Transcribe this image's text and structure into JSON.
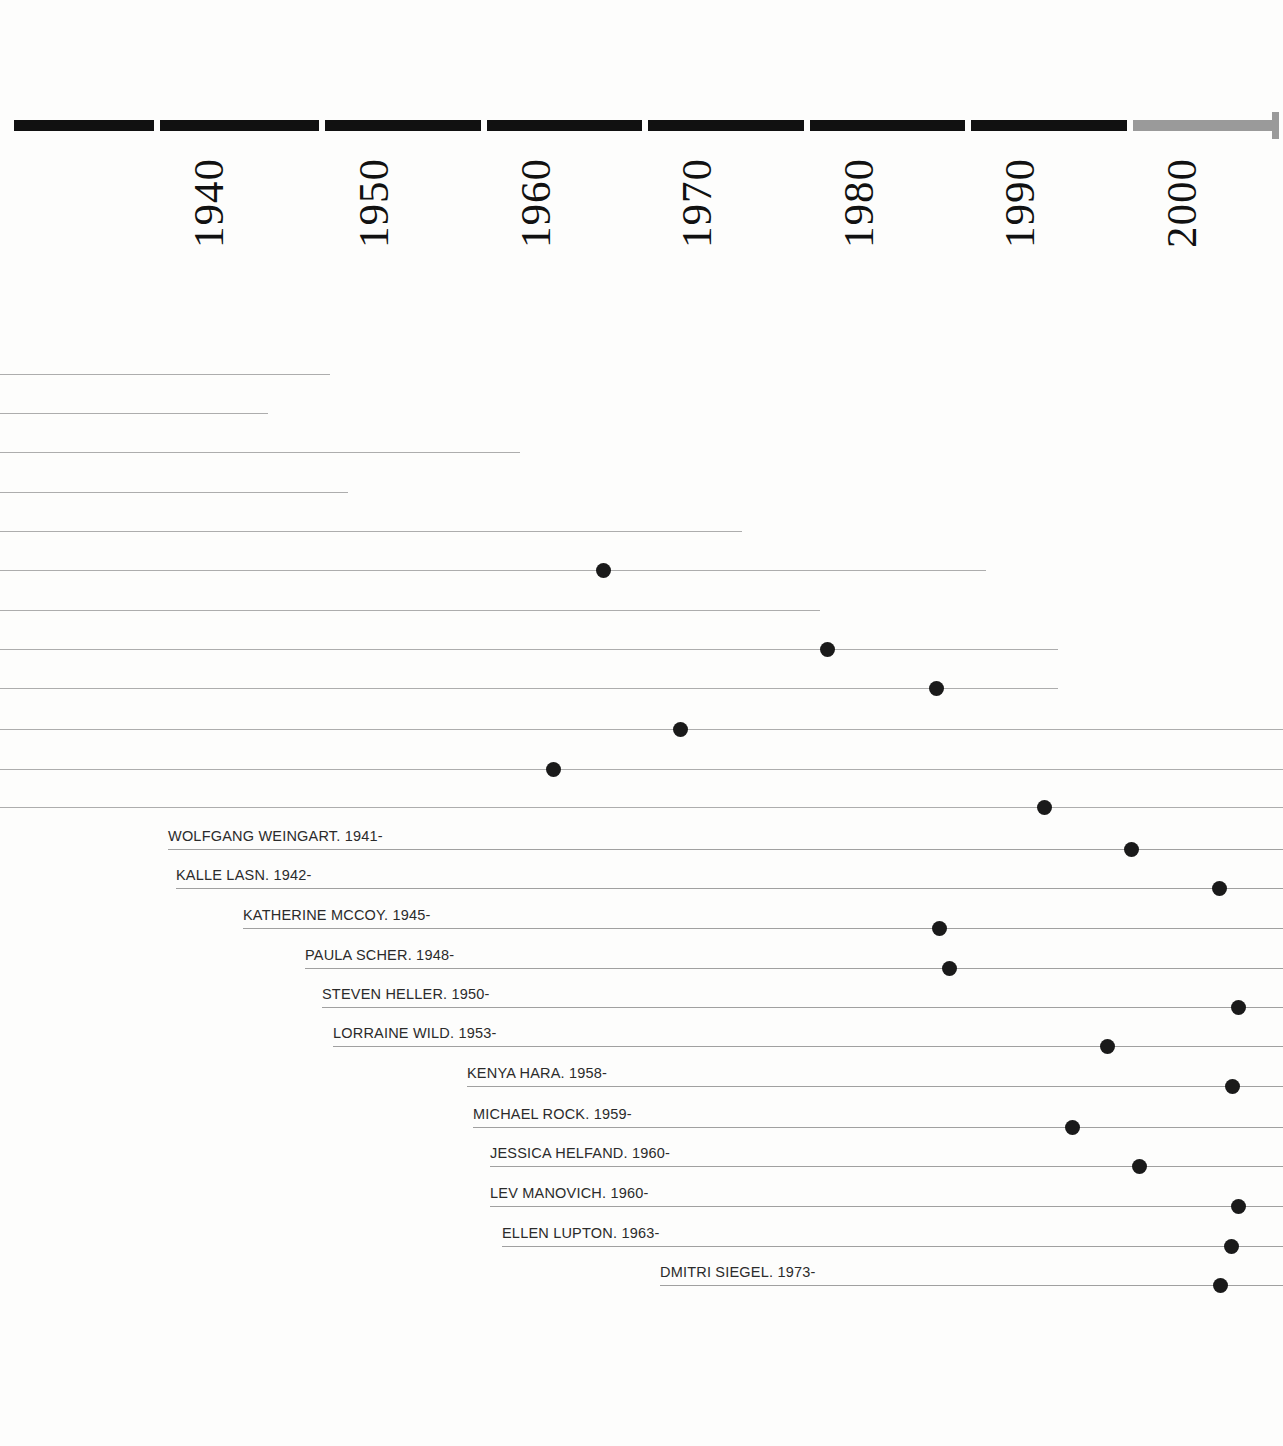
{
  "chart_data": {
    "type": "timeline",
    "title": "",
    "xlabel": "",
    "ylabel": "",
    "grid": false,
    "legend": null,
    "axis": {
      "tick_labels": [
        "1940",
        "1950",
        "1960",
        "1970",
        "1980",
        "1990",
        "2000"
      ],
      "tick_values": [
        1940,
        1950,
        1960,
        1970,
        1980,
        1990,
        2000
      ],
      "tick_x_px": [
        157,
        322,
        484,
        645,
        807,
        968,
        1130
      ],
      "px_per_decade": 162,
      "past_color": "#111111",
      "future_color": "#9a9a9a",
      "future_starts_at": 2000,
      "orientation": "horizontal",
      "label_rotation_deg": -90
    },
    "rows": [
      {
        "label": "",
        "y": 374,
        "line_start_x": 0,
        "line_end_x": 330,
        "dot_x": null,
        "birth_year": null
      },
      {
        "label": "",
        "y": 413,
        "line_start_x": 0,
        "line_end_x": 268,
        "dot_x": null,
        "birth_year": null
      },
      {
        "label": "",
        "y": 452,
        "line_start_x": 0,
        "line_end_x": 520,
        "dot_x": null,
        "birth_year": null
      },
      {
        "label": "",
        "y": 492,
        "line_start_x": 0,
        "line_end_x": 348,
        "dot_x": null,
        "birth_year": null
      },
      {
        "label": "",
        "y": 531,
        "line_start_x": 0,
        "line_end_x": 742,
        "dot_x": null,
        "birth_year": null
      },
      {
        "label": "",
        "y": 570,
        "line_start_x": 0,
        "line_end_x": 986,
        "dot_x": 603,
        "birth_year": 1967
      },
      {
        "label": "",
        "y": 610,
        "line_start_x": 0,
        "line_end_x": 820,
        "dot_x": null,
        "birth_year": null
      },
      {
        "label": "",
        "y": 649,
        "line_start_x": 0,
        "line_end_x": 1058,
        "dot_x": 827,
        "birth_year": 1981
      },
      {
        "label": "",
        "y": 688,
        "line_start_x": 0,
        "line_end_x": 1058,
        "dot_x": 936,
        "birth_year": 1988
      },
      {
        "label": "",
        "y": 729,
        "line_start_x": 0,
        "line_end_x": 1283,
        "dot_x": 680,
        "birth_year": 1972
      },
      {
        "label": "",
        "y": 769,
        "line_start_x": 0,
        "line_end_x": 1283,
        "dot_x": 553,
        "birth_year": 1964
      },
      {
        "label": "",
        "y": 807,
        "line_start_x": 0,
        "line_end_x": 1283,
        "dot_x": 1044,
        "birth_year": 1995
      },
      {
        "label": "WOLFGANG WEINGART. 1941-",
        "y": 849,
        "line_start_x": 168,
        "line_end_x": 1283,
        "dot_x": 1131,
        "birth_year": 1941
      },
      {
        "label": "KALLE LASN. 1942-",
        "y": 888,
        "line_start_x": 176,
        "line_end_x": 1283,
        "dot_x": 1219,
        "birth_year": 1942
      },
      {
        "label": "KATHERINE MCCOY. 1945-",
        "y": 928,
        "line_start_x": 243,
        "line_end_x": 1283,
        "dot_x": 939,
        "birth_year": 1945
      },
      {
        "label": "PAULA SCHER. 1948-",
        "y": 968,
        "line_start_x": 305,
        "line_end_x": 1283,
        "dot_x": 949,
        "birth_year": 1948
      },
      {
        "label": "STEVEN HELLER. 1950-",
        "y": 1007,
        "line_start_x": 322,
        "line_end_x": 1283,
        "dot_x": 1238,
        "birth_year": 1950
      },
      {
        "label": "LORRAINE WILD. 1953-",
        "y": 1046,
        "line_start_x": 333,
        "line_end_x": 1283,
        "dot_x": 1107,
        "birth_year": 1953
      },
      {
        "label": "KENYA HARA. 1958-",
        "y": 1086,
        "line_start_x": 467,
        "line_end_x": 1283,
        "dot_x": 1232,
        "birth_year": 1958
      },
      {
        "label": "MICHAEL ROCK. 1959-",
        "y": 1127,
        "line_start_x": 473,
        "line_end_x": 1283,
        "dot_x": 1072,
        "birth_year": 1959
      },
      {
        "label": "JESSICA HELFAND. 1960-",
        "y": 1166,
        "line_start_x": 490,
        "line_end_x": 1283,
        "dot_x": 1139,
        "birth_year": 1960
      },
      {
        "label": "LEV MANOVICH. 1960-",
        "y": 1206,
        "line_start_x": 490,
        "line_end_x": 1283,
        "dot_x": 1238,
        "birth_year": 1960
      },
      {
        "label": "ELLEN LUPTON. 1963-",
        "y": 1246,
        "line_start_x": 502,
        "line_end_x": 1283,
        "dot_x": 1231,
        "birth_year": 1963
      },
      {
        "label": "DMITRI SIEGEL. 1973-",
        "y": 1285,
        "line_start_x": 660,
        "line_end_x": 1283,
        "dot_x": 1220,
        "birth_year": 1973
      }
    ]
  }
}
